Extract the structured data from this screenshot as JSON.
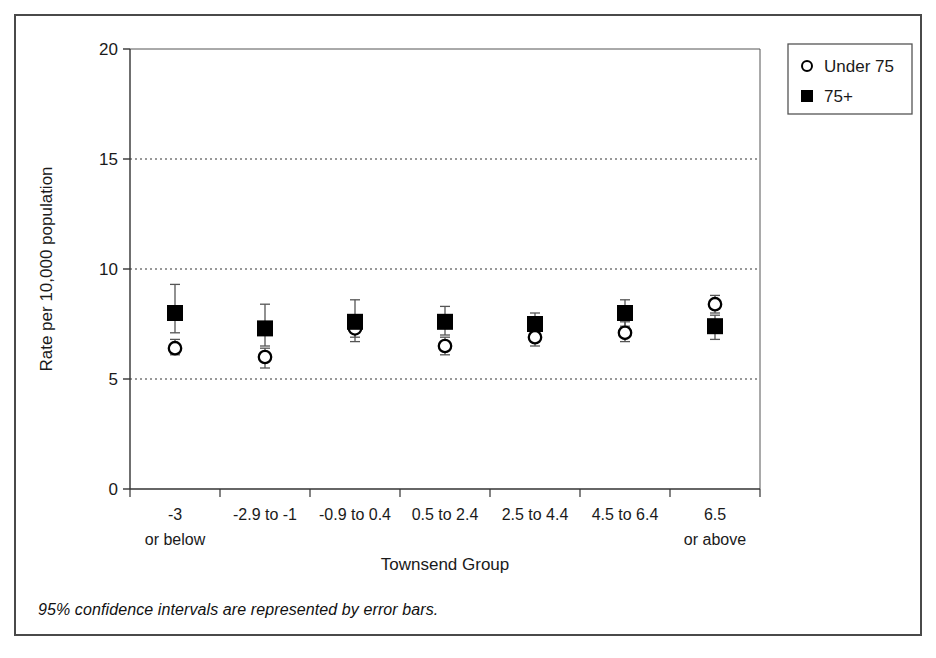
{
  "figure": {
    "footnote": "95% confidence intervals are represented by error bars.",
    "border_color": "#4a4a4a",
    "background": "#ffffff"
  },
  "chart_data": {
    "type": "scatter",
    "title": "",
    "xlabel": "Townsend Group",
    "ylabel": "Rate per 10,000 population",
    "ylim": [
      0,
      20
    ],
    "yticks": [
      0,
      5,
      10,
      15,
      20
    ],
    "ytick_labels": [
      "0",
      "5",
      "10",
      "15",
      "20"
    ],
    "grid": "horizontal-dotted",
    "legend_position": "top-right",
    "categories": [
      "-3\nor below",
      "-2.9 to -1",
      "-0.9 to 0.4",
      "0.5 to 2.4",
      "2.5 to 4.4",
      "4.5 to 6.4",
      "6.5\nor above"
    ],
    "category_labels": [
      {
        "line1": "-3",
        "line2": "or below"
      },
      {
        "line1": "-2.9 to -1",
        "line2": ""
      },
      {
        "line1": "-0.9 to 0.4",
        "line2": ""
      },
      {
        "line1": "0.5 to 2.4",
        "line2": ""
      },
      {
        "line1": "2.5 to 4.4",
        "line2": ""
      },
      {
        "line1": "4.5 to 6.4",
        "line2": ""
      },
      {
        "line1": "6.5",
        "line2": "or above"
      }
    ],
    "series": [
      {
        "name": "Under 75",
        "marker": "open-circle",
        "color": "#000000",
        "offset": 0.0,
        "values": [
          6.4,
          6.0,
          7.3,
          6.5,
          6.9,
          7.1,
          8.4
        ],
        "ci_lower": [
          6.1,
          5.5,
          6.7,
          6.1,
          6.5,
          6.7,
          8.0
        ],
        "ci_upper": [
          6.8,
          6.4,
          7.9,
          6.9,
          7.3,
          7.6,
          8.8
        ]
      },
      {
        "name": "75+",
        "marker": "filled-square",
        "color": "#000000",
        "offset": 0.0,
        "values": [
          8.0,
          7.3,
          7.6,
          7.6,
          7.5,
          8.0,
          7.4
        ],
        "ci_lower": [
          7.1,
          6.5,
          6.9,
          7.0,
          7.1,
          7.4,
          6.8
        ],
        "ci_upper": [
          9.3,
          8.4,
          8.6,
          8.3,
          8.0,
          8.6,
          7.9
        ]
      }
    ],
    "legend": [
      {
        "label": "Under 75",
        "marker": "open-circle"
      },
      {
        "label": "75+",
        "marker": "filled-square"
      }
    ]
  }
}
